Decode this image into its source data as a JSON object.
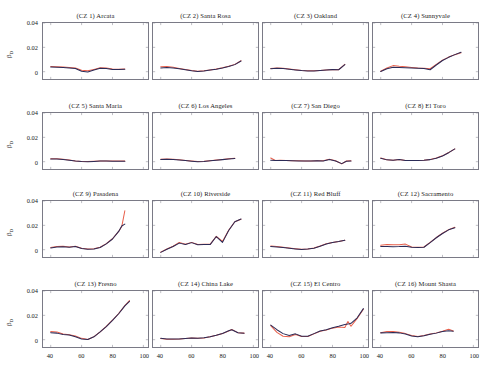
{
  "figure": {
    "rows": 4,
    "cols": 4,
    "series_colors": {
      "series1": "#E8604C",
      "series2": "#2B2B57"
    },
    "axis_color": "#7A7A86",
    "background": "#FFFFFF"
  },
  "axes": {
    "ylabel": "β",
    "ylabel_sub": "D",
    "yticks": [
      "0",
      "0.02",
      "0.04"
    ],
    "ylim": [
      -0.006,
      0.04
    ],
    "xticks": [
      "40",
      "60",
      "80",
      "100"
    ],
    "xlim": [
      35,
      103
    ],
    "grid": false,
    "legend": "none"
  },
  "chart_data": {
    "type": "line",
    "title": "",
    "xlabel": "",
    "ylabel": "β_D",
    "xlim": [
      35,
      103
    ],
    "ylim": [
      -0.006,
      0.04
    ],
    "xticks": [
      40,
      60,
      80,
      100
    ],
    "yticks": [
      0,
      0.02,
      0.04
    ],
    "grid": false,
    "legend_position": "none",
    "series_names": [
      "estimate-orange",
      "estimate-navy"
    ],
    "panels": [
      {
        "index": 1,
        "title": "(CZ 1) Arcata",
        "x": [
          40,
          44,
          48,
          52,
          56,
          60,
          64,
          68,
          72,
          76,
          80,
          84,
          88
        ],
        "series": [
          {
            "name": "estimate-orange",
            "color": "#E8604C",
            "values": [
              0.0043,
              0.0041,
              0.0038,
              0.0034,
              0.003,
              0.0012,
              0.0007,
              0.0019,
              0.0032,
              0.003,
              0.0022,
              0.0021,
              0.0023
            ]
          },
          {
            "name": "estimate-navy",
            "color": "#2B2B57",
            "values": [
              0.0038,
              0.0036,
              0.0034,
              0.003,
              0.0026,
              0.0004,
              -0.0002,
              0.0014,
              0.0028,
              0.0026,
              0.0019,
              0.0019,
              0.0021
            ]
          }
        ]
      },
      {
        "index": 2,
        "title": "(CZ 2) Santa Rosa",
        "x": [
          40,
          44,
          48,
          52,
          56,
          60,
          64,
          68,
          72,
          76,
          80,
          84,
          88,
          92
        ],
        "series": [
          {
            "name": "estimate-orange",
            "color": "#E8604C",
            "values": [
              0.004,
              0.0042,
              0.0036,
              0.0027,
              0.0018,
              0.0009,
              0.0004,
              0.0007,
              0.0014,
              0.0022,
              0.0032,
              0.0044,
              0.006,
              0.009
            ]
          },
          {
            "name": "estimate-navy",
            "color": "#2B2B57",
            "values": [
              0.003,
              0.0034,
              0.0031,
              0.0024,
              0.0016,
              0.0007,
              0.0002,
              0.0006,
              0.0013,
              0.0021,
              0.0031,
              0.0043,
              0.0058,
              0.0088
            ]
          }
        ]
      },
      {
        "index": 3,
        "title": "(CZ 3) Oakland",
        "x": [
          40,
          44,
          48,
          52,
          56,
          60,
          64,
          68,
          72,
          76,
          80,
          84,
          88
        ],
        "series": [
          {
            "name": "estimate-orange",
            "color": "#E8604C",
            "values": [
              0.0026,
              0.003,
              0.0028,
              0.0022,
              0.0016,
              0.001,
              0.0007,
              0.0007,
              0.001,
              0.0014,
              0.0018,
              0.0017,
              0.006
            ]
          },
          {
            "name": "estimate-navy",
            "color": "#2B2B57",
            "values": [
              0.0024,
              0.0028,
              0.0026,
              0.002,
              0.0014,
              0.0009,
              0.0006,
              0.0006,
              0.0009,
              0.0013,
              0.0017,
              0.0016,
              0.0058
            ]
          }
        ]
      },
      {
        "index": 4,
        "title": "(CZ 4) Sunnyvale",
        "x": [
          40,
          44,
          48,
          52,
          56,
          60,
          64,
          68,
          72,
          76,
          80,
          84,
          88,
          92
        ],
        "series": [
          {
            "name": "estimate-orange",
            "color": "#E8604C",
            "values": [
              0.0004,
              0.003,
              0.005,
              0.0044,
              0.004,
              0.0035,
              0.003,
              0.0028,
              0.0024,
              0.006,
              0.0095,
              0.012,
              0.014,
              0.0155
            ]
          },
          {
            "name": "estimate-navy",
            "color": "#2B2B57",
            "values": [
              0.0002,
              0.0024,
              0.0036,
              0.0034,
              0.0033,
              0.0031,
              0.0028,
              0.0026,
              0.0016,
              0.0055,
              0.0092,
              0.0118,
              0.014,
              0.016
            ]
          }
        ]
      },
      {
        "index": 5,
        "title": "(CZ 5) Santa Maria",
        "x": [
          40,
          44,
          48,
          52,
          56,
          60,
          64,
          68,
          72,
          76,
          80,
          84,
          88
        ],
        "series": [
          {
            "name": "estimate-orange",
            "color": "#E8604C",
            "values": [
              0.0024,
              0.0024,
              0.002,
              0.0013,
              0.0006,
              0.0002,
              0.0001,
              0.0003,
              0.0006,
              0.0006,
              0.0005,
              0.0005,
              0.0005
            ]
          },
          {
            "name": "estimate-navy",
            "color": "#2B2B57",
            "values": [
              0.0023,
              0.0023,
              0.0019,
              0.0012,
              0.0005,
              0.0001,
              0.0,
              0.0002,
              0.0005,
              0.0005,
              0.0004,
              0.0004,
              0.0004
            ]
          }
        ]
      },
      {
        "index": 6,
        "title": "(CZ 6) Los Angeles",
        "x": [
          40,
          44,
          48,
          52,
          56,
          60,
          64,
          68,
          72,
          76,
          80,
          84,
          88
        ],
        "series": [
          {
            "name": "estimate-orange",
            "color": "#E8604C",
            "values": [
              0.002,
              0.0022,
              0.002,
              0.0015,
              0.001,
              0.0005,
              0.0001,
              0.0003,
              0.0008,
              0.0013,
              0.0018,
              0.0024,
              0.0028
            ]
          },
          {
            "name": "estimate-navy",
            "color": "#2B2B57",
            "values": [
              0.0019,
              0.0021,
              0.0019,
              0.0014,
              0.0009,
              0.0004,
              0.0,
              0.0002,
              0.0007,
              0.0012,
              0.0017,
              0.0023,
              0.0027
            ]
          }
        ]
      },
      {
        "index": 7,
        "title": "(CZ 7) San Diego",
        "x": [
          40,
          43,
          46,
          50,
          54,
          58,
          62,
          66,
          70,
          74,
          78,
          82,
          86,
          89,
          92
        ],
        "series": [
          {
            "name": "estimate-orange",
            "color": "#E8604C",
            "values": [
              0.003,
              0.001,
              0.0011,
              0.001,
              0.0008,
              0.0007,
              0.0006,
              0.0006,
              0.0008,
              0.0007,
              0.002,
              0.0008,
              -0.0018,
              0.0006,
              0.0008
            ]
          },
          {
            "name": "estimate-navy",
            "color": "#2B2B57",
            "values": [
              0.0012,
              0.0009,
              0.001,
              0.0009,
              0.0007,
              0.0006,
              0.0005,
              0.0005,
              0.0007,
              0.0006,
              0.0018,
              0.0006,
              -0.0016,
              0.0004,
              0.0005
            ]
          }
        ]
      },
      {
        "index": 8,
        "title": "(CZ 8) El Toro",
        "x": [
          40,
          44,
          48,
          52,
          56,
          60,
          64,
          68,
          72,
          76,
          80,
          84,
          88
        ],
        "series": [
          {
            "name": "estimate-orange",
            "color": "#E8604C",
            "values": [
              0.003,
              0.0016,
              0.0012,
              0.0019,
              0.001,
              0.001,
              0.001,
              0.0012,
              0.0018,
              0.003,
              0.0048,
              0.0075,
              0.0105
            ]
          },
          {
            "name": "estimate-navy",
            "color": "#2B2B57",
            "values": [
              0.0028,
              0.0015,
              0.0011,
              0.0018,
              0.0009,
              0.0009,
              0.0009,
              0.0011,
              0.0017,
              0.0029,
              0.0047,
              0.0074,
              0.0105
            ]
          }
        ]
      },
      {
        "index": 9,
        "title": "(CZ 9) Pasadena",
        "x": [
          40,
          44,
          48,
          52,
          56,
          60,
          64,
          68,
          72,
          76,
          80,
          84,
          86,
          88
        ],
        "series": [
          {
            "name": "estimate-orange",
            "color": "#E8604C",
            "values": [
              0.0018,
              0.0026,
              0.0028,
              0.0022,
              0.0028,
              0.0012,
              0.0006,
              0.0008,
              0.002,
              0.005,
              0.009,
              0.015,
              0.019,
              0.032
            ]
          },
          {
            "name": "estimate-navy",
            "color": "#2B2B57",
            "values": [
              0.0014,
              0.0022,
              0.0025,
              0.002,
              0.0026,
              0.001,
              0.0004,
              0.0006,
              0.0018,
              0.0048,
              0.0088,
              0.015,
              0.0195,
              0.021
            ]
          }
        ]
      },
      {
        "index": 10,
        "title": "(CZ 10) Riverside",
        "x": [
          40,
          44,
          48,
          52,
          56,
          60,
          64,
          68,
          72,
          76,
          80,
          84,
          88,
          92
        ],
        "series": [
          {
            "name": "estimate-orange",
            "color": "#E8604C",
            "values": [
              -0.002,
              0.0006,
              0.0028,
              0.006,
              0.0044,
              0.006,
              0.0042,
              0.0044,
              0.0044,
              0.011,
              0.0068,
              0.016,
              0.023,
              0.025
            ]
          },
          {
            "name": "estimate-navy",
            "color": "#2B2B57",
            "values": [
              -0.0022,
              0.0004,
              0.0026,
              0.0054,
              0.0042,
              0.0058,
              0.004,
              0.0042,
              0.0042,
              0.0108,
              0.006,
              0.0158,
              0.023,
              0.0252
            ]
          }
        ]
      },
      {
        "index": 11,
        "title": "(CZ 11) Red Bluff",
        "x": [
          40,
          44,
          48,
          52,
          56,
          60,
          64,
          68,
          72,
          76,
          80,
          84,
          88
        ],
        "series": [
          {
            "name": "estimate-orange",
            "color": "#E8604C",
            "values": [
              0.003,
              0.0026,
              0.002,
              0.0014,
              0.0008,
              0.0003,
              0.0006,
              0.0014,
              0.003,
              0.0048,
              0.006,
              0.0068,
              0.0078
            ]
          },
          {
            "name": "estimate-navy",
            "color": "#2B2B57",
            "values": [
              0.0026,
              0.0023,
              0.0018,
              0.0012,
              0.0006,
              0.0001,
              0.0005,
              0.0012,
              0.0029,
              0.0047,
              0.006,
              0.0068,
              0.0078
            ]
          }
        ]
      },
      {
        "index": 12,
        "title": "(CZ 12) Sacramento",
        "x": [
          40,
          44,
          48,
          52,
          56,
          60,
          64,
          68,
          72,
          76,
          80,
          84,
          88
        ],
        "series": [
          {
            "name": "estimate-orange",
            "color": "#E8604C",
            "values": [
              0.0036,
              0.0042,
              0.004,
              0.004,
              0.0046,
              0.0022,
              0.002,
              0.0022,
              0.006,
              0.01,
              0.0135,
              0.0165,
              0.0185
            ]
          },
          {
            "name": "estimate-navy",
            "color": "#2B2B57",
            "values": [
              0.0026,
              0.0026,
              0.0025,
              0.0026,
              0.0028,
              0.002,
              0.0018,
              0.002,
              0.0058,
              0.0098,
              0.0133,
              0.0163,
              0.018
            ]
          }
        ]
      },
      {
        "index": 13,
        "title": "(CZ 13) Fresno",
        "x": [
          40,
          44,
          48,
          52,
          56,
          60,
          64,
          68,
          72,
          76,
          80,
          84,
          88,
          91
        ],
        "series": [
          {
            "name": "estimate-orange",
            "color": "#E8604C",
            "values": [
              0.0068,
              0.0064,
              0.0046,
              0.004,
              0.003,
              0.0011,
              0.0001,
              0.0025,
              0.0065,
              0.011,
              0.016,
              0.0215,
              0.028,
              0.0322
            ]
          },
          {
            "name": "estimate-navy",
            "color": "#2B2B57",
            "values": [
              0.0058,
              0.0054,
              0.0042,
              0.0038,
              0.0024,
              0.0006,
              0.0001,
              0.0024,
              0.0064,
              0.0108,
              0.0158,
              0.0213,
              0.0278,
              0.0315
            ]
          }
        ]
      },
      {
        "index": 14,
        "title": "(CZ 14) China Lake",
        "x": [
          40,
          44,
          48,
          52,
          56,
          60,
          64,
          68,
          72,
          76,
          80,
          84,
          86,
          90,
          94
        ],
        "series": [
          {
            "name": "estimate-orange",
            "color": "#E8604C",
            "values": [
              0.001,
              0.0004,
              0.0004,
              0.0005,
              0.0009,
              0.0013,
              0.0011,
              0.0014,
              0.0024,
              0.0036,
              0.005,
              0.0072,
              0.0084,
              0.0058,
              0.0054
            ]
          },
          {
            "name": "estimate-navy",
            "color": "#2B2B57",
            "values": [
              0.0011,
              0.0006,
              0.0005,
              0.0006,
              0.001,
              0.0014,
              0.0012,
              0.0015,
              0.0025,
              0.0037,
              0.0051,
              0.0073,
              0.0082,
              0.0057,
              0.0053
            ]
          }
        ]
      },
      {
        "index": 15,
        "title": "(CZ 15) El Centro",
        "x": [
          40,
          44,
          48,
          52,
          56,
          60,
          64,
          68,
          72,
          76,
          80,
          84,
          88,
          90,
          92,
          96,
          100
        ],
        "series": [
          {
            "name": "estimate-orange",
            "color": "#E8604C",
            "values": [
              0.0115,
              0.006,
              0.0028,
              0.0024,
              0.0042,
              0.0026,
              0.0026,
              0.0048,
              0.007,
              0.008,
              0.0095,
              0.0105,
              0.01,
              0.015,
              0.011,
              0.0175,
              0.025
            ]
          },
          {
            "name": "estimate-navy",
            "color": "#2B2B57",
            "values": [
              0.012,
              0.0082,
              0.005,
              0.0034,
              0.0048,
              0.0028,
              0.0028,
              0.005,
              0.0072,
              0.0082,
              0.0098,
              0.011,
              0.0125,
              0.0128,
              0.0135,
              0.018,
              0.0255
            ]
          }
        ]
      },
      {
        "index": 16,
        "title": "(CZ 16) Mount Shasta",
        "x": [
          40,
          44,
          48,
          52,
          56,
          60,
          64,
          68,
          72,
          76,
          80,
          84,
          87
        ],
        "series": [
          {
            "name": "estimate-orange",
            "color": "#E8604C",
            "values": [
              0.0058,
              0.0068,
              0.0068,
              0.0062,
              0.005,
              0.0034,
              0.0026,
              0.0034,
              0.0046,
              0.0056,
              0.007,
              0.0086,
              0.0072
            ]
          },
          {
            "name": "estimate-navy",
            "color": "#2B2B57",
            "values": [
              0.0056,
              0.0058,
              0.006,
              0.0056,
              0.0046,
              0.003,
              0.0024,
              0.0032,
              0.0044,
              0.0054,
              0.0068,
              0.0074,
              0.007
            ]
          }
        ]
      }
    ]
  }
}
